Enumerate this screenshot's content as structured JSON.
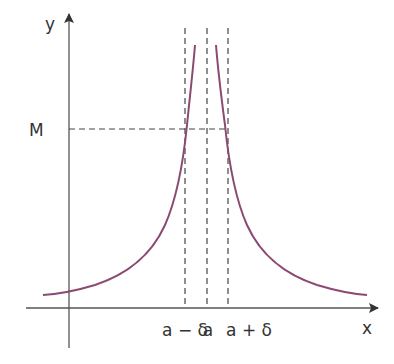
{
  "diagram": {
    "axes": {
      "x_label": "x",
      "y_label": "y"
    },
    "labels": {
      "M": "M",
      "a_minus_delta": "a − δ",
      "a": "a",
      "a_plus_delta": "a + δ"
    },
    "colors": {
      "curve": "#8b4a72",
      "axis": "#555555",
      "dash": "#444444",
      "text": "#333333"
    }
  }
}
